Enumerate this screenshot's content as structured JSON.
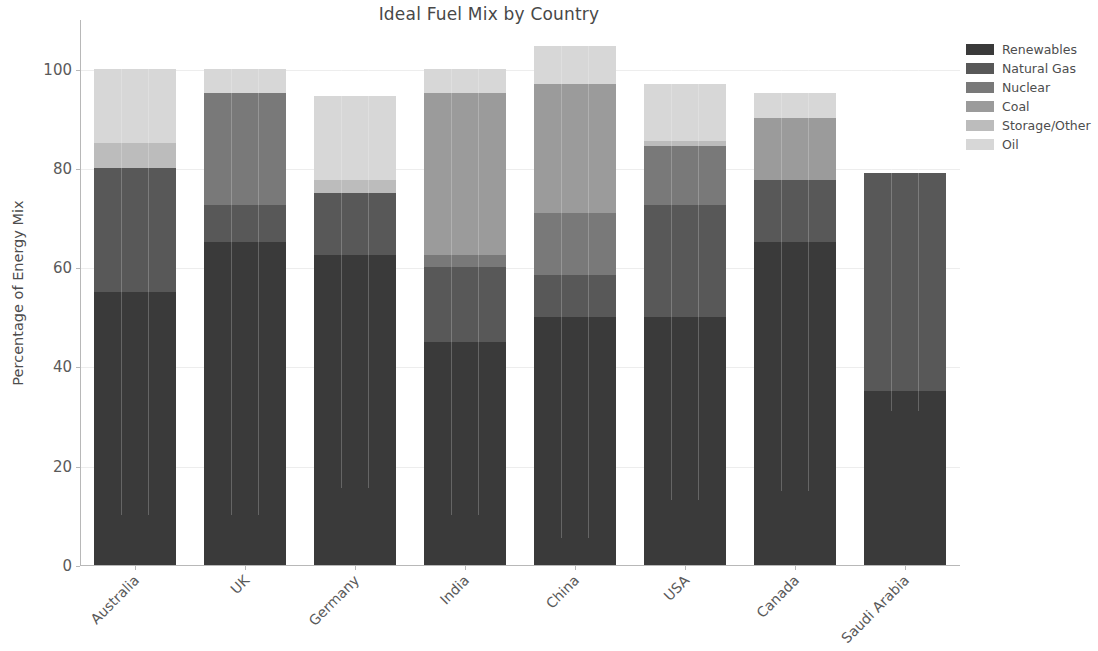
{
  "chart_data": {
    "type": "bar",
    "subtype": "stacked-bar",
    "title": "Ideal Fuel Mix by Country",
    "xlabel": "",
    "ylabel": "Percentage of Energy Mix",
    "categories": [
      "Australia",
      "UK",
      "Germany",
      "India",
      "China",
      "USA",
      "Canada",
      "Saudi Arabia"
    ],
    "ylim": [
      0,
      110
    ],
    "yticks": [
      0,
      20,
      40,
      60,
      80,
      100
    ],
    "ytick_labels": [
      "0",
      "20",
      "40",
      "60",
      "80",
      "100"
    ],
    "grid": true,
    "legend_position": "upper right",
    "series": [
      {
        "name": "Renewables",
        "color": "#3a3a3a",
        "values": [
          55.0,
          65.0,
          62.5,
          45.0,
          50.0,
          50.0,
          65.0,
          35.0
        ]
      },
      {
        "name": "Natural Gas",
        "color": "#585858",
        "values": [
          25.0,
          7.5,
          12.5,
          15.0,
          8.5,
          22.5,
          12.5,
          44.0
        ]
      },
      {
        "name": "Nuclear",
        "color": "#797979",
        "values": [
          0.0,
          22.5,
          0.0,
          2.5,
          12.5,
          12.0,
          0.0,
          0.0
        ]
      },
      {
        "name": "Coal",
        "color": "#9b9b9b",
        "values": [
          0.0,
          0.0,
          0.0,
          32.5,
          26.0,
          0.0,
          12.5,
          0.0
        ]
      },
      {
        "name": "Storage/Other",
        "color": "#bcbcbc",
        "values": [
          5.0,
          0.0,
          2.5,
          0.0,
          0.0,
          1.0,
          0.0,
          0.0
        ]
      },
      {
        "name": "Oil",
        "color": "#d7d7d7",
        "values": [
          15.0,
          5.0,
          17.0,
          5.0,
          7.5,
          11.5,
          5.0,
          0.0
        ]
      }
    ],
    "totals": [
      100.0,
      100.0,
      94.5,
      100.0,
      104.5,
      97.0,
      100.0,
      79.0
    ]
  },
  "legend": {
    "items": [
      "Renewables",
      "Natural Gas",
      "Nuclear",
      "Coal",
      "Storage/Other",
      "Oil"
    ]
  },
  "axes": {
    "ylabel": "Percentage of Energy Mix"
  },
  "header": {
    "title": "Ideal Fuel Mix by Country"
  }
}
